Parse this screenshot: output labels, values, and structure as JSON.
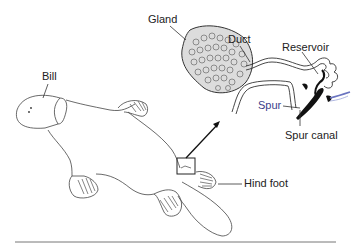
{
  "diagram": {
    "labels": {
      "bill": "Bill",
      "gland": "Gland",
      "duct": "Duct",
      "reservoir": "Reservoir",
      "spur": "Spur",
      "spur_canal": "Spur canal",
      "hind_foot": "Hind foot"
    },
    "colors": {
      "line": "#333333",
      "spur": "#111111",
      "spur_label": "#3b3f8c",
      "gland_fill": "#d9d9d9",
      "rule": "#666666"
    }
  }
}
